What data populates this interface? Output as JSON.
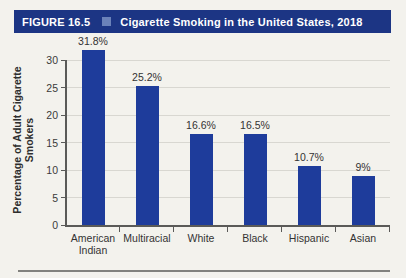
{
  "figure_header": {
    "label": "FIGURE 16.5",
    "bullet_icon": "square-bullet",
    "title": "Cigarette Smoking in the United States, 2018",
    "bg_color": "#1c3584",
    "text_color": "#ffffff",
    "bullet_color": "#6b82b9"
  },
  "chart_data": {
    "type": "bar",
    "title": "Cigarette Smoking in the United States, 2018",
    "categories": [
      "American Indian",
      "Multiracial",
      "White",
      "Black",
      "Hispanic",
      "Asian"
    ],
    "values": [
      31.8,
      25.2,
      16.6,
      16.5,
      10.7,
      9
    ],
    "value_labels": [
      "31.8%",
      "25.2%",
      "16.6%",
      "16.5%",
      "10.7%",
      "9%"
    ],
    "xlabel": "",
    "ylabel": "Percentage of Adult Cigarette Smokers",
    "ylabel_lines": [
      "Percentage of Adult Cigarette",
      "Smokers"
    ],
    "ylim": [
      0,
      30
    ],
    "yticks": [
      0,
      5,
      10,
      15,
      20,
      25,
      30
    ],
    "grid": true,
    "legend_position": "none",
    "bar_color": "#1e3c9b",
    "gridline_color": "#d8d7d1",
    "axis_color": "#5a5a58"
  }
}
